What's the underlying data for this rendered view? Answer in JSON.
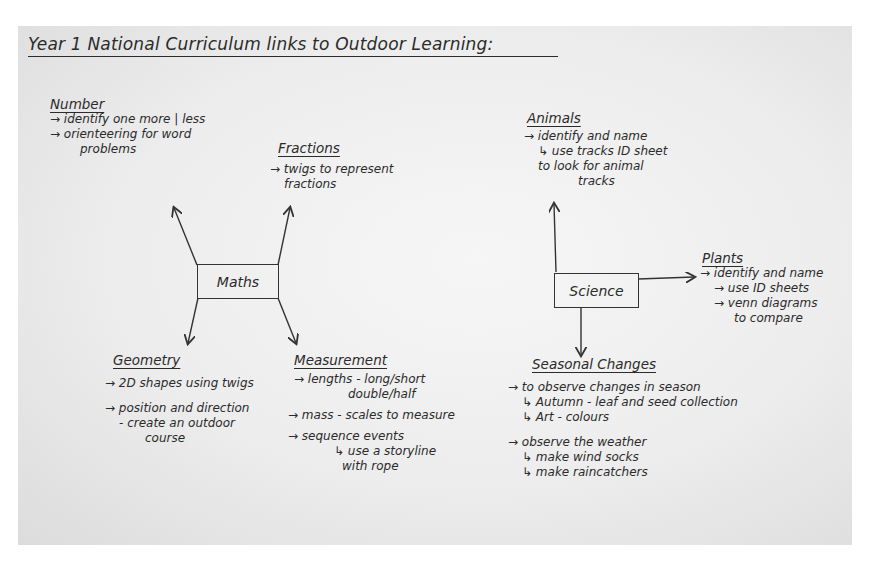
{
  "title": "Year 1 National Curriculum links to Outdoor Learning:",
  "maths": {
    "label": "Maths",
    "number": {
      "heading": "Number",
      "items": [
        "→ identify one more | less",
        "→ orienteering for word",
        "problems"
      ]
    },
    "fractions": {
      "heading": "Fractions",
      "items": [
        "→ twigs to represent",
        "fractions"
      ]
    },
    "geometry": {
      "heading": "Geometry",
      "items": [
        "→ 2D shapes using twigs",
        "→ position and direction",
        "- create an outdoor",
        "course"
      ]
    },
    "measurement": {
      "heading": "Measurement",
      "items": [
        "→ lengths - long/short",
        "double/half",
        "→ mass - scales to measure",
        "→ sequence events",
        "↳ use a storyline",
        "with rope"
      ]
    }
  },
  "science": {
    "label": "Science",
    "animals": {
      "heading": "Animals",
      "items": [
        "→ identify and name",
        "↳ use tracks ID sheet",
        "to look for animal",
        "tracks"
      ]
    },
    "plants": {
      "heading": "Plants",
      "items": [
        "→ identify and name",
        "→ use ID sheets",
        "→ venn diagrams",
        "to compare"
      ]
    },
    "seasonal": {
      "heading": "Seasonal Changes",
      "items": [
        "→ to observe changes in season",
        "↳ Autumn - leaf and seed collection",
        "↳ Art - colours",
        "→ observe the weather",
        "↳ make wind socks",
        "↳ make raincatchers"
      ]
    }
  }
}
